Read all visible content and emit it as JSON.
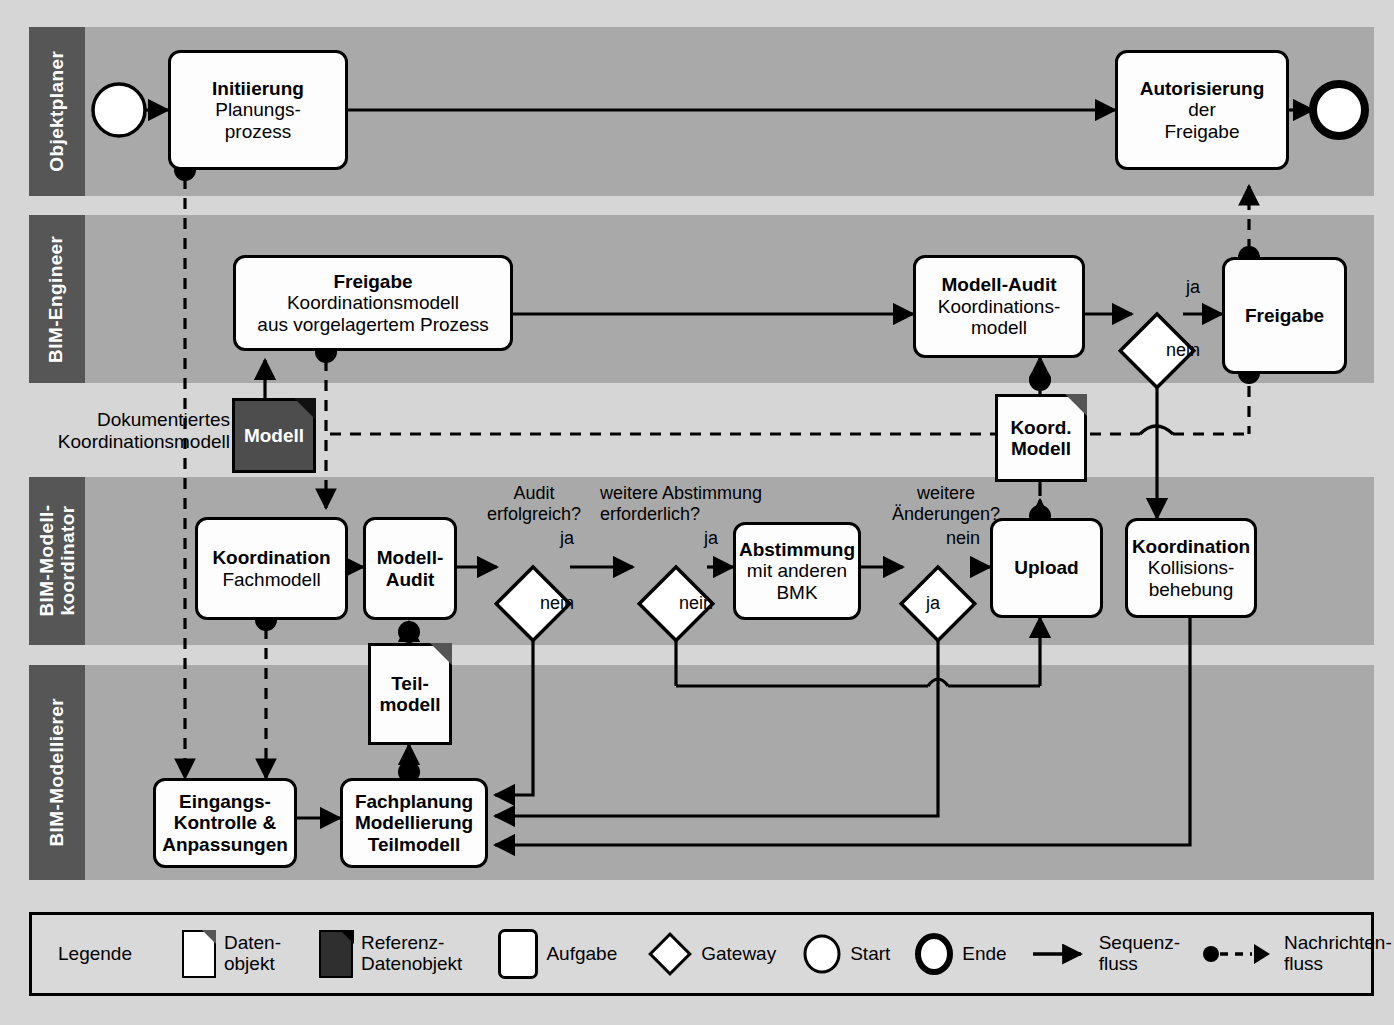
{
  "diagram": {
    "type": "bpmn-collaboration-diagram",
    "title_visible": false,
    "colors": {
      "page_background": "#d6d6d6",
      "lane_background": "#a9a9a9",
      "lane_label_background": "#565656",
      "lane_label_text": "#ffffff",
      "shape_fill": "#fdfdfd",
      "reference_data_object_fill": "#4d4d4d",
      "stroke": "#000000",
      "legend_background": "#d9d9d9"
    }
  },
  "lanes": [
    {
      "id": "objektplaner",
      "label": "Objektplaner"
    },
    {
      "id": "bim-engineer",
      "label": "BIM-Engineer"
    },
    {
      "id": "bim-modellkoordinator",
      "label": "BIM-Modell-\nkoordinator",
      "label_line1": "BIM-Modell-",
      "label_line2": "koordinator"
    },
    {
      "id": "bim-modellierer",
      "label": "BIM-Modellierer"
    }
  ],
  "tasks": [
    {
      "id": "initiierung",
      "line1": "Initiierung",
      "line2": "Planungs-",
      "line3": "prozess"
    },
    {
      "id": "autorisierung",
      "line1": "Autorisierung",
      "line2": "der",
      "line3": "Freigabe"
    },
    {
      "id": "freigabe-koord",
      "line1": "Freigabe",
      "line2": "Koordinationsmodell",
      "line3": "aus vorgelagertem Prozess"
    },
    {
      "id": "modell-audit-koordinationsmodell",
      "line1": "Modell-Audit",
      "line2": "Koordinations-",
      "line3": "modell"
    },
    {
      "id": "freigabe",
      "line1": "Freigabe",
      "line2": "",
      "line3": ""
    },
    {
      "id": "koordination-fachmodell",
      "line1": "Koordination",
      "line2": "Fachmodell",
      "line3": ""
    },
    {
      "id": "modell-audit",
      "line1": "Modell-",
      "line2": "Audit",
      "line3": "",
      "bold_all": true
    },
    {
      "id": "abstimmung",
      "line1": "Abstimmung",
      "line2": "mit anderen",
      "line3": "BMK"
    },
    {
      "id": "upload",
      "line1": "Upload",
      "line2": "",
      "line3": ""
    },
    {
      "id": "koordination-kollision",
      "line1": "Koordination",
      "line2": "Kollisions-",
      "line3": "behebung"
    },
    {
      "id": "eingangskontrolle",
      "line1": "Eingangs-",
      "line2": "Kontrolle &",
      "line3": "Anpassungen",
      "bold_all": true
    },
    {
      "id": "fachplanung",
      "line1": "Fachplanung",
      "line2": "Modellierung",
      "line3": "Teilmodell",
      "bold_all": true
    }
  ],
  "data_objects": [
    {
      "id": "modell",
      "label_line1": "Modell",
      "label_line2": "",
      "kind": "reference"
    },
    {
      "id": "koord-modell",
      "label_line1": "Koord.",
      "label_line2": "Modell",
      "kind": "data"
    },
    {
      "id": "teilmodell",
      "label_line1": "Teil-",
      "label_line2": "modell",
      "kind": "data"
    }
  ],
  "annotations": [
    {
      "id": "dokumentiertes-koordinationsmodell",
      "line1": "Dokumentiertes",
      "line2": "Koordinationsmodell"
    },
    {
      "id": "audit-erfolgreich",
      "line1": "Audit",
      "line2": "erfolgreich?"
    },
    {
      "id": "weitere-abstimmung",
      "line1": "weitere Abstimmung",
      "line2": "erforderlich?"
    },
    {
      "id": "weitere-aenderungen",
      "line1": "weitere",
      "line2": "Änderungen?"
    }
  ],
  "flow_labels": {
    "ja": "ja",
    "nein": "nein"
  },
  "gateway_labels": [
    {
      "id": "gw-freigabe-ja",
      "text": "ja"
    },
    {
      "id": "gw-freigabe-nein",
      "text": "nein"
    },
    {
      "id": "gw-audit-ja",
      "text": "ja"
    },
    {
      "id": "gw-audit-nein",
      "text": "nein"
    },
    {
      "id": "gw-abstimmung-ja",
      "text": "ja"
    },
    {
      "id": "gw-abstimmung-nein",
      "text": "nein"
    },
    {
      "id": "gw-aenderungen-nein",
      "text": "nein"
    },
    {
      "id": "gw-aenderungen-ja",
      "text": "ja"
    }
  ],
  "legend": {
    "title": "Legende",
    "items": [
      {
        "id": "datenobjekt",
        "line1": "Daten-",
        "line2": "objekt",
        "icon": "document-icon"
      },
      {
        "id": "referenz-datenobjekt",
        "line1": "Referenz-",
        "line2": "Datenobjekt",
        "icon": "reference-document-icon"
      },
      {
        "id": "aufgabe",
        "line1": "Aufgabe",
        "line2": "",
        "icon": "task-icon"
      },
      {
        "id": "gateway",
        "line1": "Gateway",
        "line2": "",
        "icon": "gateway-diamond-icon"
      },
      {
        "id": "start",
        "line1": "Start",
        "line2": "",
        "icon": "start-event-icon"
      },
      {
        "id": "ende",
        "line1": "Ende",
        "line2": "",
        "icon": "end-event-icon"
      },
      {
        "id": "sequenzfluss",
        "line1": "Sequenz-",
        "line2": "fluss",
        "icon": "solid-arrow-icon"
      },
      {
        "id": "nachrichtenfluss",
        "line1": "Nachrichten-",
        "line2": "fluss",
        "icon": "dashed-message-arrow-icon"
      }
    ]
  }
}
